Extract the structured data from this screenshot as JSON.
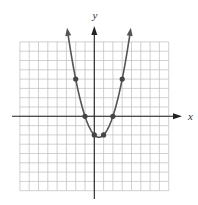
{
  "chart_data": {
    "type": "line",
    "title": "",
    "xlabel": "x",
    "ylabel": "y",
    "function": "y = x^2 - x - 2",
    "xlim": [
      -8,
      8
    ],
    "ylim": [
      -8,
      8
    ],
    "grid": true,
    "grid_step": 1,
    "tick_labels": false,
    "legend": null,
    "series": [
      {
        "name": "parabola",
        "style": "curve with arrows at both ends",
        "x_range": [
          -2.93,
          3.93
        ],
        "marked_points": [
          {
            "x": -2,
            "y": 4
          },
          {
            "x": -1,
            "y": 0
          },
          {
            "x": 0,
            "y": -2
          },
          {
            "x": 1,
            "y": -2
          },
          {
            "x": 2,
            "y": 0
          },
          {
            "x": 3,
            "y": 4
          }
        ]
      }
    ]
  },
  "layout": {
    "origin_px": [
      94.3,
      116.3
    ],
    "unit_px": 9.3,
    "x_axis_px": [
      12,
      182
    ],
    "y_axis_px": [
      26,
      199
    ],
    "x_label_pos": [
      188,
      120
    ],
    "y_label_pos": [
      95,
      19
    ]
  },
  "colors": {
    "grid": "#bdbdbd",
    "axis": "#222222",
    "curve": "#555555",
    "point": "#444444"
  }
}
